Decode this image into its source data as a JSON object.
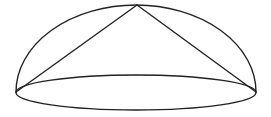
{
  "diagram": {
    "stroke_color": "#222222",
    "background": "#ffffff",
    "base_ellipse": {
      "cx": 136,
      "cy": 92.5,
      "rx": 120,
      "ry": 17.5
    },
    "dome_arc": {
      "start": [
        16,
        92
      ],
      "apex": [
        137,
        5
      ],
      "end": [
        256,
        92
      ]
    },
    "cone_apex": [
      137,
      5
    ],
    "cone_base_left": [
      16,
      92
    ],
    "cone_base_right": [
      256,
      92
    ]
  }
}
